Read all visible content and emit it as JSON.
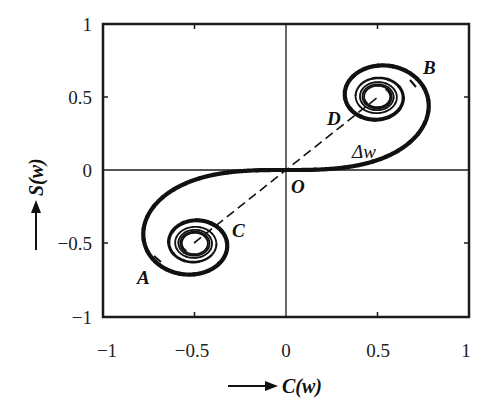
{
  "chart_data": {
    "type": "line",
    "title": "",
    "subtitle": "Cornu (Euler) spiral",
    "xlabel": "C(w)",
    "ylabel": "S(w)",
    "xlim": [
      -1,
      1
    ],
    "ylim": [
      -1,
      1
    ],
    "grid": false,
    "legend": "none",
    "x_ticks": [
      "−1",
      "−0.5",
      "0",
      "0.5",
      "1"
    ],
    "y_ticks": [
      "1",
      "0.5",
      "0",
      "−0.5",
      "−1"
    ],
    "x_tick_values": [
      -1,
      -0.5,
      0,
      0.5,
      1
    ],
    "y_tick_values": [
      1,
      0.5,
      0,
      -0.5,
      -1
    ],
    "series": [
      {
        "name": "Cornu spiral (C(w), S(w))",
        "param": "w",
        "w_range": [
          -5,
          5
        ],
        "limit_points": [
          [
            0.5,
            0.5
          ],
          [
            -0.5,
            -0.5
          ]
        ],
        "style": "thick solid, thin toward limit points"
      }
    ],
    "annotations": [
      {
        "label": "A",
        "x": -0.72,
        "y": -0.62,
        "desc": "marker on lower-left arc"
      },
      {
        "label": "B",
        "x": 0.72,
        "y": 0.57,
        "desc": "marker on upper-right arc"
      },
      {
        "label": "C",
        "x": -0.4,
        "y": -0.38,
        "desc": "point on inner lower-left coil"
      },
      {
        "label": "D",
        "x": 0.4,
        "y": 0.38,
        "desc": "point on inner upper-right coil"
      },
      {
        "label": "O",
        "x": 0,
        "y": 0,
        "desc": "origin"
      },
      {
        "label": "Δw",
        "x": 0.4,
        "y": 0.12,
        "desc": "arc length segment"
      }
    ],
    "dashed_lines": [
      {
        "from": [
          -0.5,
          -0.5
        ],
        "to": [
          0.5,
          0.5
        ],
        "desc": "dashed chord through origin joining the limit points"
      }
    ]
  },
  "labels": {
    "A": "A",
    "B": "B",
    "C": "C",
    "D": "D",
    "O": "O",
    "dw": "Δw",
    "xlabel": "C(w)",
    "ylabel": "S(w)"
  },
  "colors": {
    "curve": "#111111",
    "frame": "#1a1a1a",
    "background": "#ffffff"
  }
}
